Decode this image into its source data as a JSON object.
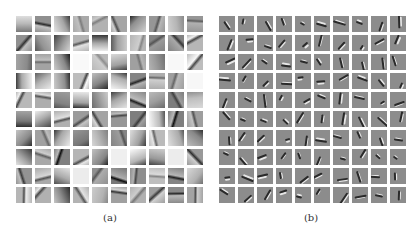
{
  "figure": {
    "panels": [
      {
        "id": "a",
        "label": "(a)",
        "rows": 10,
        "cols": 10,
        "description": "Learned filters with smooth, low-frequency gradient patches"
      },
      {
        "id": "b",
        "label": "(b)",
        "rows": 10,
        "cols": 10,
        "description": "Learned filters with localized oriented edge strokes on gray background"
      }
    ]
  }
}
